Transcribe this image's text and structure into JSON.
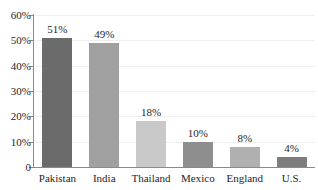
{
  "chart_data": {
    "type": "bar",
    "title": "",
    "xlabel": "",
    "ylabel": "",
    "ylim": [
      0,
      60
    ],
    "grid": true,
    "legend": "none",
    "categories": [
      "Pakistan",
      "India",
      "Thailand",
      "Mexico",
      "England",
      "U.S."
    ],
    "values": [
      51,
      49,
      18,
      10,
      8,
      4
    ],
    "value_labels": [
      "51%",
      "49%",
      "18%",
      "10%",
      "8%",
      "4%"
    ],
    "bar_colors": [
      "#6b6b6b",
      "#a0a0a0",
      "#c9c9c9",
      "#8e8e8e",
      "#b0b0b0",
      "#7d7d7d"
    ],
    "y_ticks": [
      {
        "value": 60,
        "label": "60%"
      },
      {
        "value": 50,
        "label": "50%"
      },
      {
        "value": 40,
        "label": "40%"
      },
      {
        "value": 30,
        "label": "30%"
      },
      {
        "value": 20,
        "label": "20%"
      },
      {
        "value": 10,
        "label": "10%"
      },
      {
        "value": 0,
        "label": "0"
      }
    ]
  }
}
